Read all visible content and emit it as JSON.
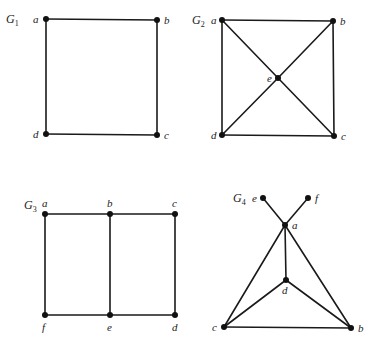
{
  "colors": {
    "background": "#ffffff",
    "edge": "#1a1a1a",
    "node": "#111111",
    "text": "#222222"
  },
  "graphs": [
    {
      "id": "G1",
      "label": "G",
      "subscript": "1",
      "label_pos": [
        6,
        23
      ],
      "nodes": [
        {
          "id": "a",
          "x": 46,
          "y": 19,
          "lx": 33,
          "ly": 23
        },
        {
          "id": "b",
          "x": 157,
          "y": 20,
          "lx": 164,
          "ly": 24
        },
        {
          "id": "c",
          "x": 157,
          "y": 135,
          "lx": 164,
          "ly": 139
        },
        {
          "id": "d",
          "x": 46,
          "y": 134,
          "lx": 33,
          "ly": 138
        }
      ],
      "edges": [
        [
          "a",
          "b"
        ],
        [
          "b",
          "c"
        ],
        [
          "c",
          "d"
        ],
        [
          "d",
          "a"
        ]
      ]
    },
    {
      "id": "G2",
      "label": "G",
      "subscript": "2",
      "label_pos": [
        192,
        24
      ],
      "nodes": [
        {
          "id": "a",
          "x": 222,
          "y": 20,
          "lx": 211,
          "ly": 24
        },
        {
          "id": "b",
          "x": 333,
          "y": 21,
          "lx": 340,
          "ly": 25
        },
        {
          "id": "c",
          "x": 334,
          "y": 136,
          "lx": 341,
          "ly": 140
        },
        {
          "id": "d",
          "x": 222,
          "y": 135,
          "lx": 211,
          "ly": 139
        },
        {
          "id": "e",
          "x": 278,
          "y": 78,
          "lx": 267,
          "ly": 82
        }
      ],
      "edges": [
        [
          "a",
          "b"
        ],
        [
          "b",
          "c"
        ],
        [
          "c",
          "d"
        ],
        [
          "d",
          "a"
        ],
        [
          "a",
          "e"
        ],
        [
          "e",
          "c"
        ],
        [
          "b",
          "e"
        ],
        [
          "e",
          "d"
        ]
      ]
    },
    {
      "id": "G3",
      "label": "G",
      "subscript": "3",
      "label_pos": [
        24,
        209
      ],
      "nodes": [
        {
          "id": "a",
          "x": 45,
          "y": 214,
          "lx": 42,
          "ly": 207
        },
        {
          "id": "b",
          "x": 110,
          "y": 214,
          "lx": 107,
          "ly": 207
        },
        {
          "id": "c",
          "x": 175,
          "y": 214,
          "lx": 172,
          "ly": 207
        },
        {
          "id": "d",
          "x": 175,
          "y": 315,
          "lx": 172,
          "ly": 331
        },
        {
          "id": "e",
          "x": 110,
          "y": 315,
          "lx": 107,
          "ly": 331
        },
        {
          "id": "f",
          "x": 45,
          "y": 315,
          "lx": 42,
          "ly": 331
        }
      ],
      "edges": [
        [
          "a",
          "b"
        ],
        [
          "b",
          "c"
        ],
        [
          "c",
          "d"
        ],
        [
          "d",
          "e"
        ],
        [
          "e",
          "f"
        ],
        [
          "f",
          "a"
        ],
        [
          "b",
          "e"
        ]
      ]
    },
    {
      "id": "G4",
      "label": "G",
      "subscript": "4",
      "label_pos": [
        233,
        202
      ],
      "nodes": [
        {
          "id": "a",
          "x": 285,
          "y": 225,
          "lx": 292,
          "ly": 229
        },
        {
          "id": "b",
          "x": 351,
          "y": 328,
          "lx": 358,
          "ly": 332
        },
        {
          "id": "c",
          "x": 224,
          "y": 327,
          "lx": 212,
          "ly": 331
        },
        {
          "id": "d",
          "x": 286,
          "y": 280,
          "lx": 282,
          "ly": 294
        },
        {
          "id": "e",
          "x": 263,
          "y": 198,
          "lx": 252,
          "ly": 202
        },
        {
          "id": "f",
          "x": 308,
          "y": 198,
          "lx": 315,
          "ly": 202
        }
      ],
      "edges": [
        [
          "e",
          "a"
        ],
        [
          "f",
          "a"
        ],
        [
          "a",
          "c"
        ],
        [
          "a",
          "b"
        ],
        [
          "a",
          "d"
        ],
        [
          "d",
          "c"
        ],
        [
          "d",
          "b"
        ],
        [
          "c",
          "b"
        ]
      ]
    }
  ]
}
